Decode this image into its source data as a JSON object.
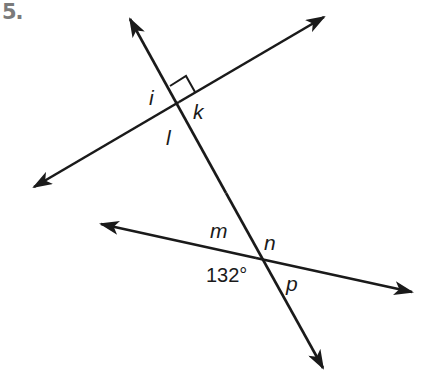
{
  "problem": {
    "number": "5."
  },
  "diagram": {
    "stroke_color": "#1a1a1a",
    "lines": [
      {
        "name": "transversal",
        "x1": 128,
        "y1": 16,
        "x2": 325,
        "y2": 371
      },
      {
        "name": "upper-line",
        "x1": 32,
        "y1": 188,
        "x2": 326,
        "y2": 16
      },
      {
        "name": "lower-line",
        "x1": 99,
        "y1": 224,
        "x2": 414,
        "y2": 293
      }
    ],
    "right_angle_marker": true,
    "angle_labels": {
      "i": "i",
      "k": "k",
      "l": "l",
      "m": "m",
      "n": "n",
      "p": "p"
    },
    "given_angle": "132°"
  }
}
